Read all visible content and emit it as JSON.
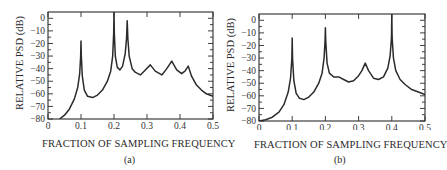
{
  "chart_data": [
    {
      "id": "a",
      "type": "line",
      "title": "",
      "caption": "(a)",
      "xlabel": "FRACTION OF SAMPLING FREQUENCY",
      "ylabel": "RELATIVE PSD (dB)",
      "xlim": [
        0,
        0.5
      ],
      "ylim": [
        -80,
        5
      ],
      "xticks": [
        0,
        0.1,
        0.2,
        0.3,
        0.4,
        0.5
      ],
      "xtick_labels": [
        "0",
        "0.1",
        "0.2",
        "0.3",
        "0.4",
        "0.5"
      ],
      "yticks": [
        0,
        -10,
        -20,
        -30,
        -40,
        -50,
        -60,
        -70,
        -80
      ],
      "ytick_labels": [
        "0",
        "-10",
        "-20",
        "-30",
        "-40",
        "-50",
        "-60",
        "-70",
        "-80"
      ],
      "grid": false,
      "series": [
        {
          "name": "PSD estimate (a)",
          "x": [
            0.035,
            0.05,
            0.065,
            0.08,
            0.09,
            0.096,
            0.099,
            0.1,
            0.101,
            0.104,
            0.11,
            0.12,
            0.135,
            0.15,
            0.165,
            0.18,
            0.19,
            0.196,
            0.199,
            0.2,
            0.201,
            0.204,
            0.21,
            0.218,
            0.226,
            0.234,
            0.238,
            0.24,
            0.242,
            0.246,
            0.255,
            0.265,
            0.28,
            0.295,
            0.31,
            0.325,
            0.345,
            0.36,
            0.375,
            0.39,
            0.405,
            0.415,
            0.425,
            0.435,
            0.45,
            0.465,
            0.48,
            0.5
          ],
          "y": [
            -80,
            -77,
            -72,
            -64,
            -55,
            -44,
            -30,
            -18,
            -30,
            -46,
            -57,
            -62,
            -63,
            -61,
            -57,
            -50,
            -42,
            -30,
            -12,
            5,
            -12,
            -30,
            -39,
            -41,
            -38,
            -28,
            -16,
            -2,
            -16,
            -30,
            -40,
            -43,
            -45,
            -41,
            -37,
            -42,
            -45,
            -40,
            -34,
            -41,
            -44,
            -42,
            -38,
            -46,
            -53,
            -57,
            -60,
            -62
          ]
        }
      ],
      "peaks": [
        {
          "x": 0.1,
          "y": -18
        },
        {
          "x": 0.2,
          "y": 5
        },
        {
          "x": 0.24,
          "y": -2
        },
        {
          "x": 0.31,
          "y": -37
        },
        {
          "x": 0.375,
          "y": -34
        },
        {
          "x": 0.425,
          "y": -38
        }
      ]
    },
    {
      "id": "b",
      "type": "line",
      "title": "",
      "caption": "(b)",
      "xlabel": "FRACTION OF SAMPLING FREQUENCY",
      "ylabel": "RELATIVE PSD (dB)",
      "xlim": [
        0,
        0.5
      ],
      "ylim": [
        -80,
        5
      ],
      "xticks": [
        0,
        0.1,
        0.2,
        0.3,
        0.4,
        0.5
      ],
      "xtick_labels": [
        "0",
        "0.1",
        "0.2",
        "0.3",
        "0.4",
        "0.5"
      ],
      "yticks": [
        0,
        -10,
        -20,
        -30,
        -40,
        -50,
        -60,
        -70,
        -80
      ],
      "ytick_labels": [
        "0",
        "-10",
        "-20",
        "-30",
        "-40",
        "-50",
        "-60",
        "-70",
        "-80"
      ],
      "grid": false,
      "series": [
        {
          "name": "PSD estimate (b)",
          "x": [
            0.0,
            0.02,
            0.04,
            0.06,
            0.075,
            0.088,
            0.095,
            0.099,
            0.1,
            0.101,
            0.105,
            0.112,
            0.122,
            0.135,
            0.15,
            0.165,
            0.18,
            0.19,
            0.196,
            0.199,
            0.2,
            0.201,
            0.205,
            0.212,
            0.225,
            0.24,
            0.255,
            0.27,
            0.285,
            0.3,
            0.31,
            0.32,
            0.33,
            0.345,
            0.36,
            0.375,
            0.388,
            0.395,
            0.399,
            0.4,
            0.401,
            0.405,
            0.412,
            0.425,
            0.44,
            0.46,
            0.48,
            0.5
          ],
          "y": [
            -80,
            -79,
            -77,
            -73,
            -67,
            -57,
            -46,
            -30,
            -14,
            -30,
            -48,
            -58,
            -62,
            -63,
            -61,
            -57,
            -50,
            -42,
            -30,
            -16,
            -6,
            -16,
            -34,
            -42,
            -45,
            -45,
            -47,
            -49,
            -48,
            -44,
            -40,
            -34,
            -40,
            -46,
            -47,
            -45,
            -38,
            -28,
            -14,
            5,
            -14,
            -30,
            -40,
            -47,
            -51,
            -55,
            -57,
            -59
          ]
        }
      ],
      "peaks": [
        {
          "x": 0.1,
          "y": -14
        },
        {
          "x": 0.2,
          "y": -6
        },
        {
          "x": 0.32,
          "y": -34
        },
        {
          "x": 0.4,
          "y": 5
        }
      ]
    }
  ],
  "panels": [
    {
      "caption": "(a)",
      "xlabel": "FRACTION OF SAMPLING FREQUENCY",
      "ylabel": "RELATIVE PSD (dB)"
    },
    {
      "caption": "(b)",
      "xlabel": "FRACTION OF SAMPLING FREQUENCY",
      "ylabel": "RELATIVE PSD (dB)"
    }
  ],
  "style": {
    "line_color": "#2b2b2b",
    "axis_color": "#2b2b2b",
    "background": "#ffffff"
  }
}
